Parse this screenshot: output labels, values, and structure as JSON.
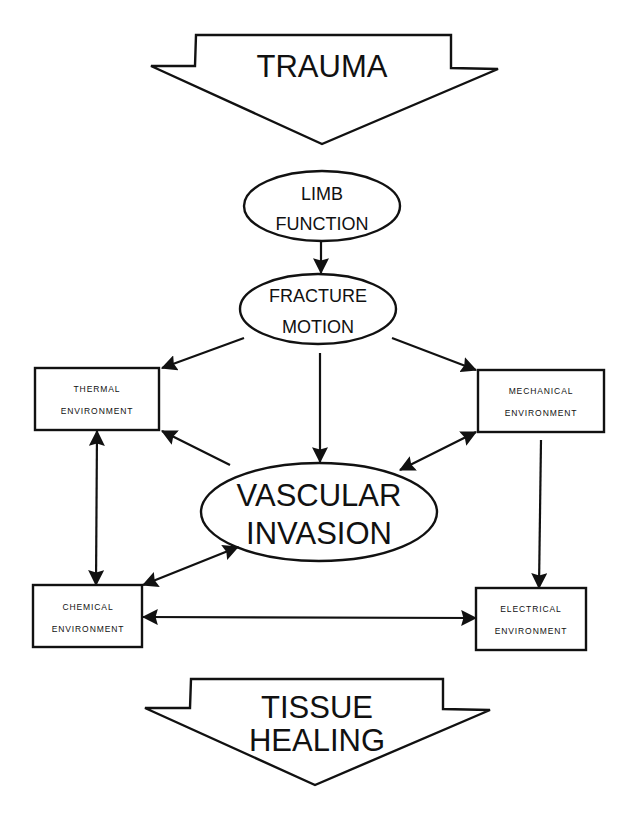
{
  "diagram": {
    "top_arrow": {
      "label": "TRAUMA"
    },
    "bottom_arrow": {
      "line1": "TISSUE",
      "line2": "HEALING"
    },
    "nodes": {
      "limb_function": {
        "line1": "LIMB",
        "line2": "FUNCTION"
      },
      "fracture_motion": {
        "line1": "FRACTURE",
        "line2": "MOTION"
      },
      "vascular_invasion": {
        "line1": "VASCULAR",
        "line2": "INVASION"
      },
      "thermal": {
        "line1": "THERMAL",
        "line2": "ENVIRONMENT"
      },
      "mechanical": {
        "line1": "MECHANICAL",
        "line2": "ENVIRONMENT"
      },
      "chemical": {
        "line1": "CHEMICAL",
        "line2": "ENVIRONMENT"
      },
      "electrical": {
        "line1": "ELECTRICAL",
        "line2": "ENVIRONMENT"
      }
    },
    "edges": [
      {
        "from": "LIMB FUNCTION",
        "to": "FRACTURE MOTION",
        "type": "one-way"
      },
      {
        "from": "FRACTURE MOTION",
        "to": "THERMAL ENVIRONMENT",
        "type": "one-way"
      },
      {
        "from": "FRACTURE MOTION",
        "to": "MECHANICAL ENVIRONMENT",
        "type": "one-way"
      },
      {
        "from": "FRACTURE MOTION",
        "to": "VASCULAR INVASION",
        "type": "one-way"
      },
      {
        "from": "VASCULAR INVASION",
        "to": "THERMAL ENVIRONMENT",
        "type": "one-way"
      },
      {
        "from": "VASCULAR INVASION",
        "to": "MECHANICAL ENVIRONMENT",
        "type": "two-way"
      },
      {
        "from": "VASCULAR INVASION",
        "to": "CHEMICAL ENVIRONMENT",
        "type": "two-way"
      },
      {
        "from": "THERMAL ENVIRONMENT",
        "to": "CHEMICAL ENVIRONMENT",
        "type": "two-way"
      },
      {
        "from": "MECHANICAL ENVIRONMENT",
        "to": "ELECTRICAL ENVIRONMENT",
        "type": "one-way"
      },
      {
        "from": "CHEMICAL ENVIRONMENT",
        "to": "ELECTRICAL ENVIRONMENT",
        "type": "two-way"
      }
    ],
    "colors": {
      "stroke": "#111111",
      "background": "#ffffff"
    }
  }
}
